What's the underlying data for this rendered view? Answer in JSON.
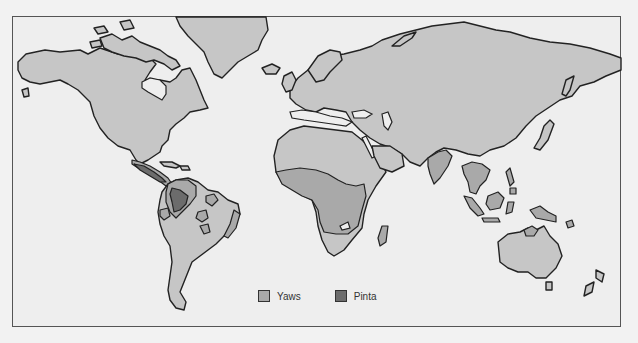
{
  "colors": {
    "background": "#eeeeee",
    "land": "#c6c6c6",
    "yaws": "#a9a9a9",
    "pinta": "#6c6c6c",
    "outline": "#222222"
  },
  "legend": {
    "items": [
      {
        "label": "Yaws",
        "color": "#a9a9a9"
      },
      {
        "label": "Pinta",
        "color": "#6c6c6c"
      }
    ]
  },
  "regions": {
    "yaws": [
      "Central America",
      "Northern South America",
      "Eastern Brazil coast",
      "Central Africa",
      "Madagascar",
      "India",
      "Southeast Asia",
      "Indonesia",
      "Philippines",
      "New Guinea",
      "Northern Australia",
      "Pacific islands"
    ],
    "pinta": [
      "Mexico / Central America",
      "Colombia / Northwestern South America"
    ]
  }
}
